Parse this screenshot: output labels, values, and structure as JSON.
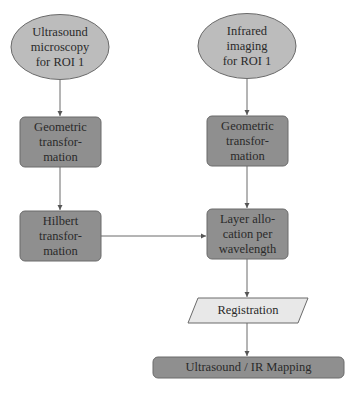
{
  "colors": {
    "start_fill": "#bcbcbc",
    "process_fill": "#8f8f8f",
    "io_fill": "#e8e8e8",
    "stroke": "#6a6a6a",
    "text": "#2a2a2a"
  },
  "nodes": {
    "us_microscopy": {
      "label": "Ultrasound\nmicroscopy\nfor ROI 1",
      "shape": "ellipse"
    },
    "ir_imaging": {
      "label": "Infrared\nimaging\nfor ROI 1",
      "shape": "ellipse"
    },
    "geo_left": {
      "label": "Geometric\ntransfor-\nmation",
      "shape": "rounded-rect"
    },
    "geo_right": {
      "label": "Geometric\ntransfor-\nmation",
      "shape": "rounded-rect"
    },
    "hilbert": {
      "label": "Hilbert\ntransfor-\nmation",
      "shape": "rounded-rect"
    },
    "layer_alloc": {
      "label": "Layer allo-\ncation per\nwavelength",
      "shape": "rounded-rect"
    },
    "registration": {
      "label": "Registration",
      "shape": "parallelogram"
    },
    "mapping": {
      "label": "Ultrasound / IR Mapping",
      "shape": "rounded-rect"
    }
  },
  "edges": [
    {
      "from": "us_microscopy",
      "to": "geo_left"
    },
    {
      "from": "geo_left",
      "to": "hilbert"
    },
    {
      "from": "ir_imaging",
      "to": "geo_right"
    },
    {
      "from": "geo_right",
      "to": "layer_alloc"
    },
    {
      "from": "hilbert",
      "to": "layer_alloc"
    },
    {
      "from": "layer_alloc",
      "to": "registration"
    },
    {
      "from": "registration",
      "to": "mapping"
    }
  ]
}
